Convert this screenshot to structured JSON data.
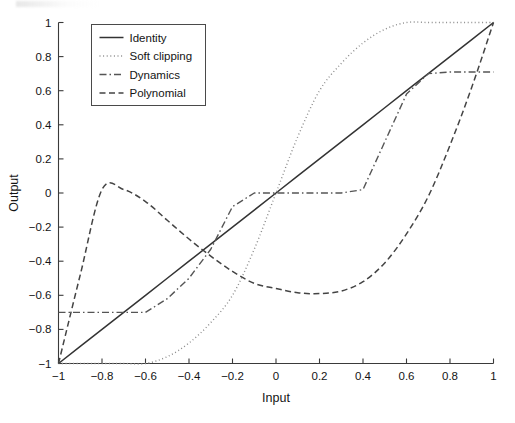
{
  "figure": {
    "background": "#ffffff",
    "ink_color": "#333333"
  },
  "chart_data": {
    "type": "line",
    "title": "",
    "xlabel": "Input",
    "ylabel": "Output",
    "xlim": [
      -1,
      1
    ],
    "ylim": [
      -1,
      1
    ],
    "grid": false,
    "legend_position": "upper-left",
    "xticks": [
      -1,
      -0.8,
      -0.6,
      -0.4,
      -0.2,
      0,
      0.2,
      0.4,
      0.6,
      0.8,
      1
    ],
    "xtick_labels": [
      "−1",
      "−0.8",
      "−0.6",
      "−0.4",
      "−0.2",
      "0",
      "0.2",
      "0.4",
      "0.6",
      "0.8",
      "1"
    ],
    "yticks": [
      -1,
      -0.8,
      -0.6,
      -0.4,
      -0.2,
      0,
      0.2,
      0.4,
      0.6,
      0.8,
      1
    ],
    "ytick_labels": [
      "−1",
      "−0.8",
      "−0.6",
      "−0.4",
      "−0.2",
      "0",
      "0.2",
      "0.4",
      "0.6",
      "0.8",
      "1"
    ],
    "x": [
      -1,
      -0.9,
      -0.8,
      -0.7,
      -0.6,
      -0.5,
      -0.4,
      -0.3,
      -0.2,
      -0.1,
      0,
      0.1,
      0.2,
      0.3,
      0.4,
      0.5,
      0.6,
      0.7,
      0.8,
      0.9,
      1
    ],
    "series": [
      {
        "name": "Identity",
        "style": "solid",
        "color": "#333333",
        "width": 1.5,
        "values": [
          -1,
          -0.9,
          -0.8,
          -0.7,
          -0.6,
          -0.5,
          -0.4,
          -0.3,
          -0.2,
          -0.1,
          0,
          0.1,
          0.2,
          0.3,
          0.4,
          0.5,
          0.6,
          0.7,
          0.8,
          0.9,
          1
        ]
      },
      {
        "name": "Soft clipping",
        "style": "dotted",
        "color": "#8c8c8c",
        "width": 1.4,
        "values": [
          -1,
          -1,
          -1,
          -1,
          -1,
          -0.96,
          -0.88,
          -0.76,
          -0.6,
          -0.33,
          0,
          0.33,
          0.6,
          0.76,
          0.88,
          0.96,
          1,
          1,
          1,
          1,
          1
        ]
      },
      {
        "name": "Dynamics",
        "style": "dashdot",
        "color": "#555555",
        "width": 1.4,
        "values": [
          -0.7,
          -0.7,
          -0.7,
          -0.7,
          -0.7,
          -0.62,
          -0.5,
          -0.33,
          -0.08,
          0,
          0,
          0,
          0,
          0,
          0.02,
          0.3,
          0.58,
          0.7,
          0.71,
          0.71,
          0.71
        ]
      },
      {
        "name": "Polynomial",
        "style": "dashed",
        "color": "#444444",
        "width": 1.5,
        "values": [
          -1.0,
          -0.48,
          0.02,
          0.02,
          -0.05,
          -0.16,
          -0.27,
          -0.37,
          -0.46,
          -0.53,
          -0.56,
          -0.585,
          -0.59,
          -0.575,
          -0.52,
          -0.41,
          -0.24,
          -0.02,
          0.28,
          0.62,
          1.0
        ]
      }
    ]
  },
  "legend": {
    "entries": [
      {
        "label": "Identity"
      },
      {
        "label": "Soft clipping"
      },
      {
        "label": "Dynamics"
      },
      {
        "label": "Polynomial"
      }
    ]
  }
}
